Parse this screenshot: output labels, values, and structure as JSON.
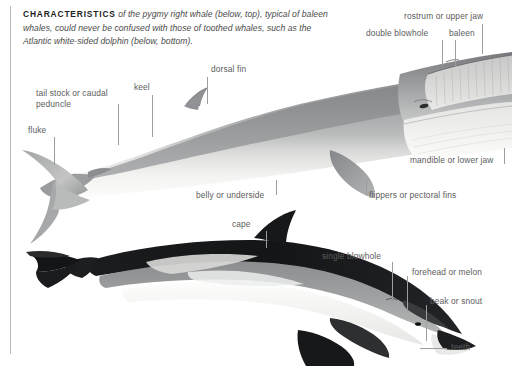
{
  "intro": {
    "lead": "CHARACTERISTICS",
    "body": " of the pygmy right whale (below, top), typical of baleen whales, could never be confused with those of toothed whales, such as the Atlantic white-sided dolphin (below, bottom)."
  },
  "whale": {
    "name": "pygmy right whale",
    "labels": {
      "rostrum": "rostrum or upper jaw",
      "double_blowhole": "double blowhole",
      "baleen": "baleen",
      "dorsal_fin": "dorsal fin",
      "keel": "keel",
      "tail_stock": "tail stock or caudal peduncle",
      "fluke": "fluke",
      "belly": "belly or underside",
      "flippers": "flippers or pectoral fins",
      "mandible": "mandible or lower jaw"
    }
  },
  "dolphin": {
    "name": "Atlantic white-sided dolphin",
    "labels": {
      "cape": "cape",
      "single_blowhole": "single blowhole",
      "forehead": "forehead or melon",
      "beak": "beak or snout",
      "teeth": "teeth"
    }
  },
  "colors": {
    "background": "#ffffff",
    "rule": "#b9b9b9",
    "label_text": "#5c5c5c",
    "leader_line": "#9d9d9d",
    "lead_text": "#1d1d1d",
    "whale_dorsal": "#8e9092",
    "whale_belly": "#f2f2f0",
    "dolphin_cape": "#17181a",
    "dolphin_flank": "#9a9b9d",
    "dolphin_belly": "#fbfbfa"
  }
}
